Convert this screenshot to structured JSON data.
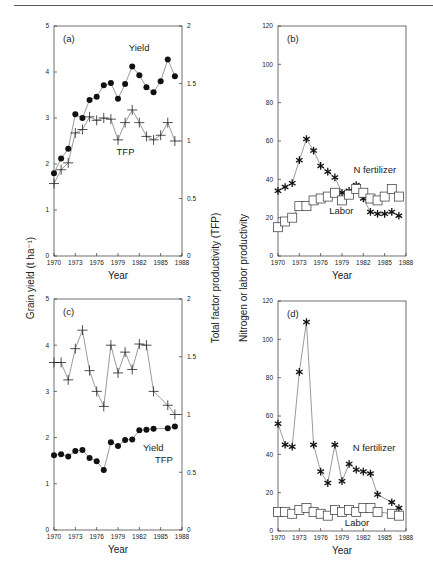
{
  "figure": {
    "y_label_left": "Grain yield (t ha⁻¹)",
    "y_label_middle": "Total factor productivity (TFP)",
    "y_label_right": "Nitrogen or labor productivity",
    "x_label": "Year"
  },
  "chart_data": [
    {
      "id": "a",
      "type": "line",
      "panel_label": "(a)",
      "xlabel": "Year",
      "ylabel": "Grain yield (t ha⁻¹)",
      "ylabel_right": "Total factor productivity (TFP)",
      "xlim": [
        1970,
        1988
      ],
      "xticks": [
        1970,
        1973,
        1976,
        1979,
        1982,
        1985,
        1988
      ],
      "ylim": [
        0,
        5
      ],
      "yticks": [
        0,
        1,
        2,
        3,
        4,
        5
      ],
      "ylim_right": [
        0,
        2
      ],
      "yticks_right": [
        0,
        0.5,
        1,
        1.5,
        2
      ],
      "ytick_labels_right": [
        "0",
        "0.5",
        "1",
        "1.5",
        "2"
      ],
      "grid": false,
      "series": [
        {
          "name": "Yield",
          "axis": "left",
          "marker": "circle",
          "x": [
            1970,
            1971,
            1972,
            1973,
            1974,
            1975,
            1976,
            1977,
            1978,
            1979,
            1980,
            1981,
            1982,
            1983,
            1984,
            1985,
            1986,
            1987
          ],
          "values": [
            1.8,
            2.12,
            2.33,
            3.08,
            3.0,
            3.39,
            3.46,
            3.71,
            3.76,
            3.42,
            3.74,
            4.12,
            3.93,
            3.67,
            3.56,
            3.8,
            4.27,
            3.91
          ],
          "label_pos": [
            1980.5,
            4.45
          ]
        },
        {
          "name": "TFP",
          "axis": "right",
          "marker": "plus",
          "x": [
            1970,
            1971,
            1972,
            1973,
            1974,
            1975,
            1976,
            1977,
            1978,
            1979,
            1980,
            1981,
            1982,
            1983,
            1984,
            1985,
            1986,
            1987
          ],
          "values": [
            0.63,
            0.75,
            0.81,
            1.07,
            1.1,
            1.21,
            1.18,
            1.2,
            1.19,
            1.01,
            1.16,
            1.27,
            1.16,
            1.04,
            1.01,
            1.05,
            1.16,
            1.0
          ],
          "label_pos": [
            1978.8,
            2.2
          ]
        }
      ]
    },
    {
      "id": "b",
      "type": "line",
      "panel_label": "(b)",
      "xlabel": "Year",
      "ylabel": "Nitrogen or labor productivity",
      "xlim": [
        1970,
        1988
      ],
      "xticks": [
        1970,
        1973,
        1976,
        1979,
        1982,
        1985,
        1988
      ],
      "ylim": [
        0,
        120
      ],
      "yticks": [
        0,
        20,
        40,
        60,
        80,
        100,
        120
      ],
      "grid": false,
      "series": [
        {
          "name": "N fertilizer",
          "marker": "star",
          "x": [
            1970,
            1971,
            1972,
            1973,
            1974,
            1975,
            1976,
            1977,
            1978,
            1979,
            1980,
            1981,
            1982,
            1983,
            1984,
            1985,
            1986,
            1987
          ],
          "values": [
            34,
            36,
            38,
            50,
            61,
            55,
            47,
            44,
            41,
            33,
            34,
            37,
            30,
            23,
            22,
            22,
            23,
            21
          ],
          "label_pos": [
            1980.6,
            43.5
          ]
        },
        {
          "name": "Labor",
          "marker": "square",
          "x": [
            1970,
            1971,
            1972,
            1973,
            1974,
            1975,
            1976,
            1977,
            1978,
            1979,
            1980,
            1981,
            1982,
            1983,
            1984,
            1985,
            1986,
            1987
          ],
          "values": [
            15,
            18,
            20,
            26,
            26,
            29,
            30,
            31,
            33,
            29,
            32,
            35,
            33,
            30,
            29,
            31,
            35,
            31
          ],
          "label_pos": [
            1977.2,
            22
          ]
        }
      ]
    },
    {
      "id": "c",
      "type": "line",
      "panel_label": "(c)",
      "xlabel": "Year",
      "ylabel": "Grain yield (t ha⁻¹)",
      "ylabel_right": "Total factor productivity (TFP)",
      "xlim": [
        1970,
        1988
      ],
      "xticks": [
        1970,
        1973,
        1976,
        1979,
        1982,
        1985,
        1988
      ],
      "ylim": [
        0,
        5
      ],
      "yticks": [
        0,
        1,
        2,
        3,
        4,
        5
      ],
      "ylim_right": [
        0,
        2
      ],
      "yticks_right": [
        0,
        0.5,
        1,
        1.5,
        2
      ],
      "ytick_labels_right": [
        "0",
        "0.5",
        "1",
        "1.5",
        "2"
      ],
      "grid": false,
      "series": [
        {
          "name": "TFP",
          "axis": "right",
          "marker": "plus",
          "x": [
            1970,
            1971,
            1972,
            1973,
            1974,
            1975,
            1976,
            1977,
            1978,
            1979,
            1980,
            1981,
            1982,
            1983,
            1984,
            1986,
            1987
          ],
          "values": [
            1.45,
            1.45,
            1.3,
            1.57,
            1.73,
            1.38,
            1.2,
            1.07,
            1.6,
            1.36,
            1.54,
            1.39,
            1.61,
            1.6,
            1.2,
            1.08,
            1.0
          ],
          "label_pos": [
            1984.2,
            1.46
          ]
        },
        {
          "name": "Yield",
          "axis": "left",
          "marker": "circle",
          "x": [
            1970,
            1971,
            1972,
            1973,
            1974,
            1975,
            1976,
            1977,
            1978,
            1979,
            1980,
            1981,
            1982,
            1983,
            1984,
            1986,
            1987
          ],
          "values": [
            1.62,
            1.64,
            1.59,
            1.71,
            1.73,
            1.56,
            1.49,
            1.3,
            1.9,
            1.82,
            1.95,
            1.96,
            2.16,
            2.17,
            2.19,
            2.2,
            2.24
          ],
          "label_pos": [
            1982.5,
            1.72
          ]
        }
      ]
    },
    {
      "id": "d",
      "type": "line",
      "panel_label": "(d)",
      "xlabel": "Year",
      "ylabel": "Nitrogen or labor productivity",
      "xlim": [
        1970,
        1988
      ],
      "xticks": [
        1970,
        1973,
        1976,
        1979,
        1982,
        1985,
        1988
      ],
      "ylim": [
        0,
        120
      ],
      "yticks": [
        0,
        20,
        40,
        60,
        80,
        100,
        120
      ],
      "grid": false,
      "series": [
        {
          "name": "N fertilizer",
          "marker": "star",
          "x": [
            1970,
            1971,
            1972,
            1973,
            1974,
            1975,
            1976,
            1977,
            1978,
            1979,
            1980,
            1981,
            1982,
            1983,
            1984,
            1986,
            1987
          ],
          "values": [
            56,
            45,
            44,
            83,
            109,
            45,
            31,
            25,
            45,
            26,
            35,
            32,
            31,
            30,
            19,
            15,
            12
          ],
          "label_pos": [
            1980.5,
            42
          ]
        },
        {
          "name": "Labor",
          "marker": "square",
          "x": [
            1970,
            1971,
            1972,
            1973,
            1974,
            1975,
            1976,
            1977,
            1978,
            1979,
            1980,
            1981,
            1982,
            1983,
            1984,
            1986,
            1987
          ],
          "values": [
            10,
            10,
            9,
            11,
            12,
            10,
            9,
            8,
            11,
            10,
            11,
            10,
            12,
            12,
            10,
            9,
            8
          ],
          "label_pos": [
            1979.4,
            2.5
          ]
        }
      ]
    }
  ]
}
